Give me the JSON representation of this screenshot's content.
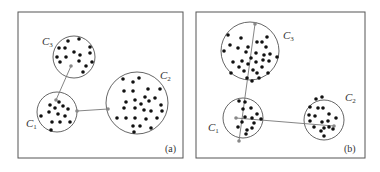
{
  "panels": [
    {
      "id": "a",
      "tag": "(a)",
      "clusters": [
        {
          "name": "C3",
          "label": "C",
          "sub": "3"
        },
        {
          "name": "C1",
          "label": "C",
          "sub": "1"
        },
        {
          "name": "C2",
          "label": "C",
          "sub": "2"
        }
      ]
    },
    {
      "id": "b",
      "tag": "(b)",
      "clusters": [
        {
          "name": "C3",
          "label": "C",
          "sub": "3"
        },
        {
          "name": "C1",
          "label": "C",
          "sub": "1"
        },
        {
          "name": "C2",
          "label": "C",
          "sub": "2"
        }
      ]
    }
  ],
  "colors": {
    "frame": "#555555",
    "circle": "#555555",
    "dot": "#111111",
    "link": "#777777",
    "linkpoint": "#888888"
  }
}
